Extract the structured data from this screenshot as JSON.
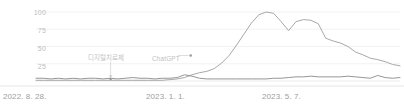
{
  "chart_data": {
    "type": "line",
    "title": "",
    "subtitle": "",
    "xlabel": "",
    "ylabel": "",
    "ylim": [
      0,
      100
    ],
    "grid": true,
    "legend_position": "none",
    "yticks": [
      100,
      75,
      50,
      25
    ],
    "ytick_labels": [
      "100",
      "75",
      "50",
      "25"
    ],
    "xtick_labels": [
      "2022. 8. 28.",
      "2023. 1. 1.",
      "2023. 5. 7."
    ],
    "xtick_positions": [
      0,
      0.355,
      0.705
    ],
    "annotations": [
      {
        "label": "디지털치료제",
        "x": 0.205,
        "y": 3,
        "pointer": "down",
        "marker": true
      },
      {
        "label": "ChatGPT",
        "x": 0.425,
        "y": 37,
        "pointer": "left",
        "marker": true
      }
    ],
    "series": [
      {
        "name": "ChatGPT",
        "color": "#9e9e9e",
        "x": [
          0,
          0.0204,
          0.0408,
          0.0612,
          0.0816,
          0.102,
          0.1224,
          0.1429,
          0.1633,
          0.1837,
          0.2041,
          0.2245,
          0.2449,
          0.2653,
          0.2857,
          0.3061,
          0.3265,
          0.3469,
          0.3673,
          0.3878,
          0.4082,
          0.4286,
          0.449,
          0.4694,
          0.4898,
          0.5102,
          0.5306,
          0.551,
          0.5714,
          0.5918,
          0.6122,
          0.6327,
          0.6531,
          0.6735,
          0.6939,
          0.7143,
          0.7347,
          0.7551,
          0.7755,
          0.7959,
          0.8163,
          0.8367,
          0.8571,
          0.8776,
          0.898,
          0.9184,
          0.9388,
          0.9592,
          0.9796,
          1.0
        ],
        "values": [
          1,
          1,
          1,
          1,
          1,
          1,
          1,
          1,
          1,
          1,
          1,
          1,
          1,
          1,
          1,
          1,
          1,
          1,
          2,
          3,
          5,
          9,
          12,
          14,
          18,
          26,
          37,
          52,
          68,
          84,
          96,
          100,
          98,
          86,
          73,
          86,
          89,
          88,
          83,
          62,
          58,
          55,
          50,
          42,
          38,
          33,
          31,
          28,
          24,
          22
        ]
      },
      {
        "name": "디지털치료제",
        "color": "#8a8a8a",
        "x": [
          0,
          0.0204,
          0.0408,
          0.0612,
          0.0816,
          0.102,
          0.1224,
          0.1429,
          0.1633,
          0.1837,
          0.2041,
          0.2245,
          0.2449,
          0.2653,
          0.2857,
          0.3061,
          0.3265,
          0.3469,
          0.3673,
          0.3878,
          0.4082,
          0.4286,
          0.449,
          0.4694,
          0.4898,
          0.5102,
          0.5306,
          0.551,
          0.5714,
          0.5918,
          0.6122,
          0.6327,
          0.6531,
          0.6735,
          0.6939,
          0.7143,
          0.7347,
          0.7551,
          0.7755,
          0.7959,
          0.8163,
          0.8367,
          0.8571,
          0.8776,
          0.898,
          0.9184,
          0.9388,
          0.9592,
          0.9796,
          1.0
        ],
        "values": [
          4,
          4,
          3,
          4,
          3,
          4,
          3,
          4,
          4,
          3,
          4,
          3,
          4,
          5,
          4,
          4,
          3,
          4,
          4,
          5,
          9,
          7,
          4,
          3,
          3,
          3,
          3,
          3,
          3,
          3,
          3,
          3,
          4,
          4,
          5,
          6,
          6,
          7,
          6,
          6,
          6,
          6,
          7,
          6,
          5,
          4,
          8,
          5,
          4,
          5
        ]
      }
    ]
  }
}
